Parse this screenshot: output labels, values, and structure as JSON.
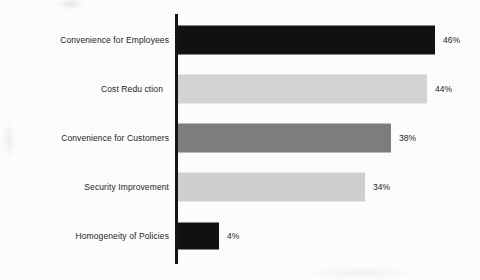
{
  "chart_data": {
    "type": "bar",
    "orientation": "horizontal",
    "title": "",
    "subtitle": "",
    "xlabel": "",
    "ylabel": "",
    "legend": [],
    "legend_position": "none",
    "grid": false,
    "axis_visible": {
      "x": false,
      "y": true
    },
    "value_label_suffix": "%",
    "xlim": [
      0,
      50
    ],
    "categories": [
      "Convenience for Employees",
      "Cost Reduction",
      "Convenience for Customers",
      "Security Improvement",
      "Homogeneity of Policies"
    ],
    "values": [
      46,
      44,
      38,
      34,
      4
    ],
    "value_labels": [
      "46%",
      "44%",
      "38%",
      "34%",
      "4%"
    ],
    "bars": [
      {
        "category": "Convenience for Employees",
        "display_label": "Convenience for Employees",
        "value": 46,
        "value_label": "46%",
        "color": "#111111",
        "color_name": "black",
        "bar_px_width": 257,
        "value_label_x": 443,
        "row_top": 17,
        "clipped": false
      },
      {
        "category": "Cost Reduction",
        "display_label": "Cost Redu ction",
        "value": 44,
        "value_label": "44%",
        "color": "#d4d4d4",
        "color_name": "light-gray",
        "bar_px_width": 249,
        "value_label_x": 435,
        "row_top": 66,
        "clipped": true
      },
      {
        "category": "Convenience for Customers",
        "display_label": "Convenience for Customers",
        "value": 38,
        "value_label": "38%",
        "color": "#7d7d7d",
        "color_name": "medium-gray",
        "bar_px_width": 213,
        "value_label_x": 399,
        "row_top": 115,
        "clipped": false
      },
      {
        "category": "Security Improvement",
        "display_label": "Security Improvement",
        "value": 34,
        "value_label": "34%",
        "color": "#d0d0d0",
        "color_name": "light-gray",
        "bar_px_width": 187,
        "value_label_x": 373,
        "row_top": 164,
        "clipped": false
      },
      {
        "category": "Homogeneity of Policies",
        "display_label": "Homogeneity of Policies",
        "value": 4,
        "value_label": "4%",
        "color": "#111111",
        "color_name": "black",
        "bar_px_width": 41,
        "value_label_x": 227,
        "row_top": 213,
        "clipped": false
      }
    ]
  }
}
